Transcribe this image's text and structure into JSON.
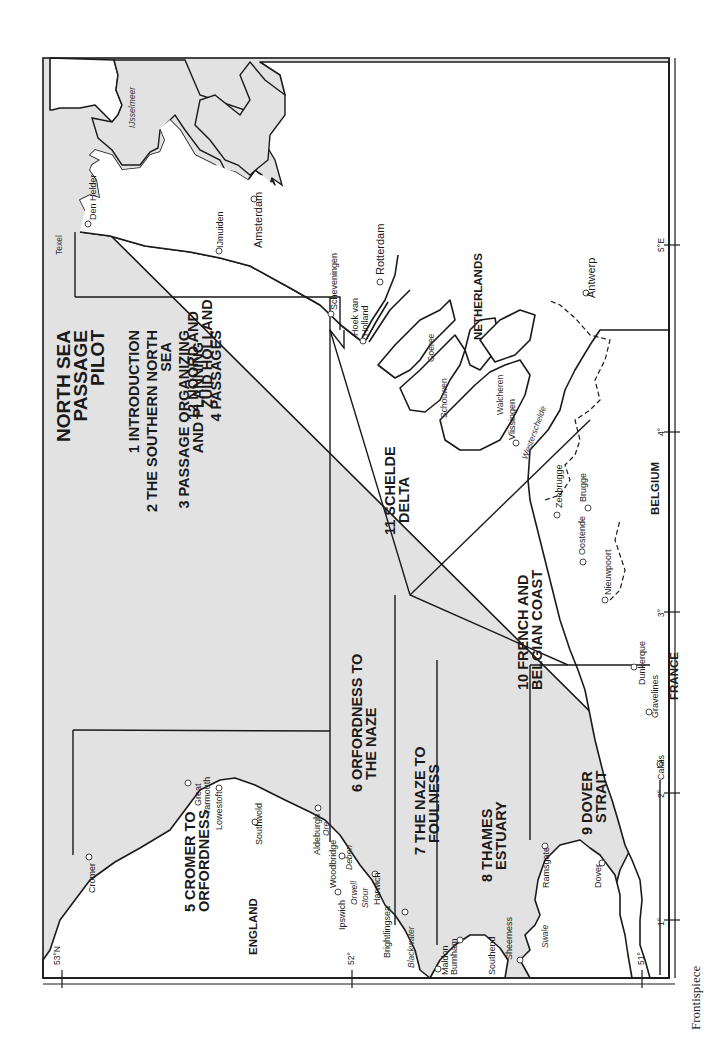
{
  "map": {
    "title_lines": [
      "NORTH SEA",
      "PASSAGE",
      "PILOT"
    ],
    "contents": [
      {
        "line1": "1 INTRODUCTION",
        "line2": ""
      },
      {
        "line1": "2 THE SOUTHERN NORTH",
        "line2": "SEA"
      },
      {
        "line1": "3 PASSAGE ORGANIZING",
        "line2": "AND PLANNING"
      },
      {
        "line1": "4 PASSAGES",
        "line2": ""
      }
    ],
    "sections": [
      {
        "id": 5,
        "line1": "5 CROMER TO",
        "line2": "ORFORDNESS"
      },
      {
        "id": 6,
        "line1": "6 ORFORDNESS TO",
        "line2": "THE NAZE"
      },
      {
        "id": 7,
        "line1": "7 THE NAZE  TO",
        "line2": "FOULNESS"
      },
      {
        "id": 8,
        "line1": "8 THAMES",
        "line2": "ESTUARY"
      },
      {
        "id": 9,
        "line1": "9 DOVER",
        "line2": "STRAIT"
      },
      {
        "id": 10,
        "line1": "10 FRENCH AND",
        "line2": "BELGIAN COAST"
      },
      {
        "id": 11,
        "line1": "11 SCHELDE",
        "line2": "DELTA"
      },
      {
        "id": 12,
        "line1": "12 NOORD AND",
        "line2": "ZUID HOLLAND"
      }
    ],
    "countries": {
      "england": "ENGLAND",
      "netherlands": "NETHERLANDS",
      "belgium": "BELGIUM",
      "france": "FRANCE"
    },
    "towns": {
      "cromer": "Cromer",
      "great": "Great",
      "yarmouth": "Yarmouth",
      "lowestoft": "Lowestoft",
      "southwold": "Southwold",
      "aldeburgh": "Aldeburgh",
      "woodbridge": "Woodbridge",
      "ipswich": "Ipswich",
      "harwich": "Harwich",
      "brightlingsea": "Brightlingsea",
      "maldon": "Maldon",
      "burnham": "Burnham",
      "southend": "Southend",
      "sheerness": "Sheerness",
      "ramsgate": "Ramsgate",
      "dover": "Dover",
      "calais": "Calais",
      "gravelines": "Gravelines",
      "dunkerque": "Dunkerque",
      "nieuwpoort": "Nieuwpoort",
      "oostende": "Oostende",
      "zeebrugge": "Zeebrugge",
      "brugge": "Brugge",
      "vlissingen": "Vlissingen",
      "antwerp": "Antwerp",
      "rotterdam": "Rotterdam",
      "hoek1": "Hoek van",
      "hoek2": "Holland",
      "scheveningen": "Scheveningen",
      "ijmuiden": "IJmuiden",
      "amsterdam": "Amsterdam",
      "den_helder": "Den Helder"
    },
    "waters": {
      "ore": "Ore",
      "deben": "Deben",
      "orwell": "Orwell",
      "stour": "Stour",
      "blackwater": "Blackwater",
      "swale": "Swale",
      "westerschelde": "Westerschelde",
      "ijsselmeer": "IJsselmeer"
    },
    "islands": {
      "texel": "Texel",
      "goeree": "Goeree",
      "schouwen": "Schouwen",
      "walcheren": "Walcheren"
    },
    "graticule": {
      "lat": [
        "53°N",
        "52°",
        "51°"
      ],
      "lon": [
        "1°",
        "2°",
        "3°",
        "4°",
        "5°E"
      ]
    },
    "colors": {
      "sea": "#e2e2e2",
      "land": "#ffffff",
      "line": "#1a1a1a"
    }
  },
  "caption": "Frontispiece"
}
